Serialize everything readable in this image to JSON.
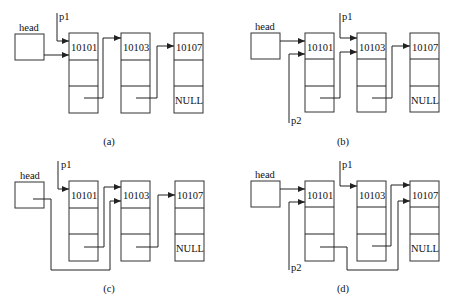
{
  "labels": {
    "head": "head",
    "p1": "p1",
    "p2": "p2",
    "null": "NULL"
  },
  "nodes": [
    "10101",
    "10103",
    "10107"
  ],
  "panels": [
    {
      "id": "a",
      "caption": "(a)"
    },
    {
      "id": "b",
      "caption": "(b)"
    },
    {
      "id": "c",
      "caption": "(c)"
    },
    {
      "id": "d",
      "caption": "(d)"
    }
  ],
  "colors": {
    "stroke": "#222222",
    "background": "#ffffff"
  }
}
